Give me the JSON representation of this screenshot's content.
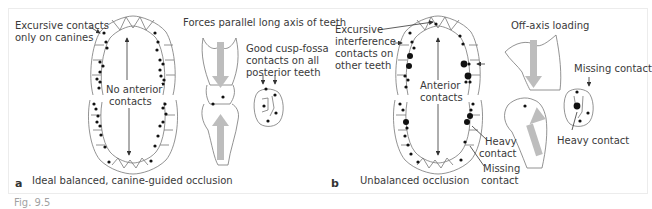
{
  "figure": {
    "panel_a": {
      "letter": "a",
      "title": "Ideal balanced, canine-guided occlusion",
      "labels": {
        "excursive_1": "Excursive contacts",
        "excursive_2": "only on canines",
        "no_anterior_1": "No anterior",
        "no_anterior_2": "contacts",
        "forces": "Forces parallel long axis of teeth",
        "good_1": "Good cusp-fossa",
        "good_2": "contacts on all",
        "good_3": "posterior teeth"
      }
    },
    "panel_b": {
      "letter": "b",
      "title": "Unbalanced occlusion",
      "labels": {
        "excursive_1": "Excursive",
        "excursive_2": "interference",
        "excursive_3": "contacts on",
        "excursive_4": "other teeth",
        "anterior_1": "Anterior",
        "anterior_2": "contacts",
        "heavy_1": "Heavy",
        "heavy_2": "contact",
        "missing_1": "Missing",
        "missing_2": "contact",
        "off_axis": "Off-axis loading",
        "missing_contact": "Missing contact",
        "heavy_contact": "Heavy contact"
      }
    },
    "caption": "Fig. 9.5"
  },
  "colors": {
    "line": "#555555",
    "dot": "#111111",
    "arrow_fill": "#bdbdbd",
    "frame": "#ececec"
  }
}
